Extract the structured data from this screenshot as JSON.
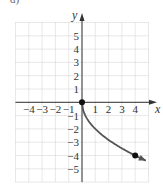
{
  "figure_label": "d)",
  "colors": {
    "grid": "#c8c8c8",
    "axis": "#333333",
    "curve": "#555555",
    "point": "#111111"
  },
  "chart_data": {
    "type": "line",
    "title": "",
    "xlabel": "x",
    "ylabel": "y",
    "xlim": [
      -5,
      5
    ],
    "ylim": [
      -6,
      6
    ],
    "grid": true,
    "legend": null,
    "x_ticks": [
      {
        "v": -4,
        "label": "−4"
      },
      {
        "v": -3,
        "label": "−3"
      },
      {
        "v": -2,
        "label": "−2"
      },
      {
        "v": -1,
        "label": "−1"
      },
      {
        "v": 1,
        "label": "1"
      },
      {
        "v": 2,
        "label": "2"
      },
      {
        "v": 3,
        "label": "3"
      },
      {
        "v": 4,
        "label": "4"
      }
    ],
    "y_ticks": [
      {
        "v": 5,
        "label": "5"
      },
      {
        "v": 4,
        "label": "4"
      },
      {
        "v": 3,
        "label": "3"
      },
      {
        "v": 2,
        "label": "2"
      },
      {
        "v": 1,
        "label": "1"
      },
      {
        "v": -1,
        "label": "−1"
      },
      {
        "v": -2,
        "label": "−2"
      },
      {
        "v": -3,
        "label": "−3"
      },
      {
        "v": -4,
        "label": "−4"
      },
      {
        "v": -5,
        "label": "−5"
      }
    ],
    "series": [
      {
        "name": "y = -2√x",
        "x": [
          0,
          0.25,
          0.5,
          1,
          1.5,
          2,
          2.5,
          3,
          3.5,
          4,
          4.8
        ],
        "values": [
          0,
          -1,
          -1.414,
          -2,
          -2.449,
          -2.828,
          -3.162,
          -3.464,
          -3.742,
          -4,
          -4.382
        ],
        "arrow_end": true
      }
    ],
    "marked_points": [
      {
        "x": 0,
        "y": 0
      },
      {
        "x": 4,
        "y": -4
      }
    ]
  }
}
